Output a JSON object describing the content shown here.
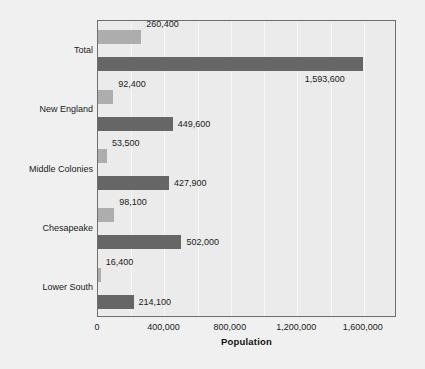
{
  "chart_data": {
    "type": "bar",
    "orientation": "horizontal",
    "title": "",
    "xlabel": "Population",
    "ylabel": "",
    "categories": [
      "Total",
      "New England",
      "Middle Colonies",
      "Chesapeake",
      "Lower South"
    ],
    "series": [
      {
        "name": "1700",
        "color": "#adadad",
        "values": [
          260400,
          92400,
          53500,
          98100,
          16400
        ],
        "value_labels": [
          "260,400",
          "92,400",
          "53,500",
          "98,100",
          "16,400"
        ]
      },
      {
        "name": "1760",
        "color": "#666666",
        "values": [
          1593600,
          449600,
          427900,
          502000,
          214100
        ],
        "value_labels": [
          "1,593,600",
          "449,600",
          "427,900",
          "502,000",
          "214,100"
        ]
      }
    ],
    "xlim": [
      0,
      1800000
    ],
    "xticks": [
      0,
      400000,
      800000,
      1200000,
      1600000
    ],
    "xtick_labels": [
      "0",
      "400,000",
      "800,000",
      "1,200,000",
      "1,600,000"
    ],
    "gridlines": true,
    "grid_interval": 200000,
    "legend_position": "middle-right",
    "legend_entries": [
      "1700",
      "1760"
    ],
    "plot_background": "#ebebeb",
    "figure_background": "#f0f0f0"
  }
}
